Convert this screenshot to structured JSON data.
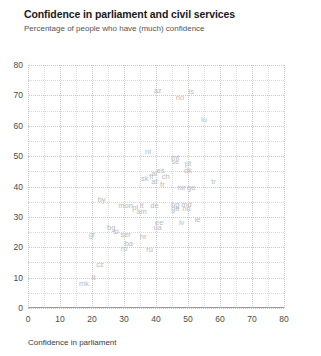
{
  "header": {
    "title": "Confidence in parliament and civil services",
    "subtitle": "Percentage of people who have (much) confidence"
  },
  "axis_label": {
    "x": "Confidence in parliament"
  },
  "colors": {
    "title": "#1a1a1a",
    "subtitle": "#555555",
    "point_label": "#b9b9b9",
    "gridline": "#d8d8d8",
    "gridline_major": "#c9c9c9",
    "axis": "#9a9a9a"
  },
  "chart_data": {
    "type": "scatter",
    "title": "Confidence in parliament and civil services",
    "subtitle": "Percentage of people who have (much) confidence",
    "xlabel": "Confidence in parliament",
    "ylabel": "",
    "xlim": [
      0,
      80
    ],
    "ylim": [
      0,
      80
    ],
    "xticks": [
      0,
      10,
      20,
      30,
      40,
      50,
      60,
      70,
      80
    ],
    "yticks": [
      0,
      10,
      20,
      30,
      40,
      50,
      60,
      70,
      80
    ],
    "grid": true,
    "grid_minor_step": 5,
    "legend": "none",
    "point_style": "text-label",
    "points": [
      {
        "label": "az",
        "x": 40.5,
        "y": 71.5
      },
      {
        "label": "is",
        "x": 51.0,
        "y": 71.0
      },
      {
        "label": "no",
        "x": 47.5,
        "y": 69.0
      },
      {
        "label": "lu",
        "x": 55.0,
        "y": 62.0
      },
      {
        "label": "nl",
        "x": 37.5,
        "y": 51.5
      },
      {
        "label": "mt",
        "x": 46.0,
        "y": 49.5
      },
      {
        "label": "se",
        "x": 46.0,
        "y": 48.0
      },
      {
        "label": "pt",
        "x": 50.0,
        "y": 47.5
      },
      {
        "label": "dk",
        "x": 50.0,
        "y": 45.0
      },
      {
        "label": "es",
        "x": 41.5,
        "y": 45.0
      },
      {
        "label": "al",
        "x": 39.5,
        "y": 44.0
      },
      {
        "label": "fi",
        "x": 38.5,
        "y": 43.0
      },
      {
        "label": "ch",
        "x": 43.0,
        "y": 43.0
      },
      {
        "label": "sk",
        "x": 36.5,
        "y": 42.5
      },
      {
        "label": "at",
        "x": 39.5,
        "y": 41.5
      },
      {
        "label": "fr",
        "x": 42.0,
        "y": 40.5
      },
      {
        "label": "tr",
        "x": 58.0,
        "y": 41.5
      },
      {
        "label": "nir",
        "x": 48.0,
        "y": 39.5
      },
      {
        "label": "ge",
        "x": 51.0,
        "y": 39.5
      },
      {
        "label": "by",
        "x": 23.0,
        "y": 35.5
      },
      {
        "label": "mon",
        "x": 30.5,
        "y": 33.5
      },
      {
        "label": "pl",
        "x": 33.5,
        "y": 33.0
      },
      {
        "label": "it",
        "x": 35.5,
        "y": 33.5
      },
      {
        "label": "de",
        "x": 39.5,
        "y": 33.5
      },
      {
        "label": "bg",
        "x": 46.0,
        "y": 34.0
      },
      {
        "label": "md",
        "x": 49.5,
        "y": 34.0
      },
      {
        "label": "gb",
        "x": 46.0,
        "y": 32.5
      },
      {
        "label": "hu",
        "x": 49.5,
        "y": 32.5
      },
      {
        "label": "am",
        "x": 35.5,
        "y": 31.5
      },
      {
        "label": "ie",
        "x": 53.0,
        "y": 29.0
      },
      {
        "label": "ee",
        "x": 41.0,
        "y": 28.0
      },
      {
        "label": "lv",
        "x": 48.0,
        "y": 28.0
      },
      {
        "label": "ua",
        "x": 40.5,
        "y": 26.5
      },
      {
        "label": "bg2",
        "x": 26.0,
        "y": 26.5
      },
      {
        "label": "si",
        "x": 27.5,
        "y": 25.0
      },
      {
        "label": "ser",
        "x": 30.5,
        "y": 24.0
      },
      {
        "label": "gr",
        "x": 20.0,
        "y": 24.0
      },
      {
        "label": "hr",
        "x": 36.0,
        "y": 23.5
      },
      {
        "label": "ba",
        "x": 31.5,
        "y": 21.0
      },
      {
        "label": "ro",
        "x": 30.0,
        "y": 19.5
      },
      {
        "label": "ru",
        "x": 38.0,
        "y": 19.0
      },
      {
        "label": "cz",
        "x": 22.5,
        "y": 14.0
      },
      {
        "label": "lt",
        "x": 20.5,
        "y": 10.0
      },
      {
        "label": "mk",
        "x": 17.5,
        "y": 8.0
      }
    ]
  }
}
